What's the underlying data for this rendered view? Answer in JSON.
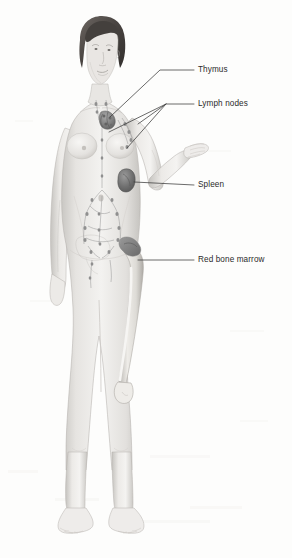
{
  "figure": {
    "background_color": "#fdfdfc",
    "line_color": "#3a3a3a",
    "text_color": "#2b2b2b"
  },
  "labels": [
    {
      "id": "thymus",
      "text": "Thymus",
      "text_x": 198,
      "text_y": 65,
      "icon": "leader-line-icon",
      "leaders": [
        {
          "points": "184,70 160,70 110,117"
        }
      ]
    },
    {
      "id": "lymph-nodes",
      "text": "Lymph nodes",
      "text_x": 198,
      "text_y": 99,
      "icon": "leader-line-icon",
      "leaders": [
        {
          "points": "184,104 166,104 109,132"
        },
        {
          "points": "184,104 166,104 127,148"
        },
        {
          "points": "184,104 166,104 138,124"
        }
      ]
    },
    {
      "id": "spleen",
      "text": "Spleen",
      "text_x": 198,
      "text_y": 180,
      "icon": "leader-line-icon",
      "leaders": [
        {
          "points": "184,185 134,182"
        }
      ]
    },
    {
      "id": "red-bone-marrow",
      "text": "Red bone marrow",
      "text_x": 198,
      "text_y": 255,
      "icon": "leader-line-icon",
      "leaders": [
        {
          "points": "184,260 138,260"
        }
      ]
    }
  ],
  "anatomy": {
    "thymus": {
      "name": "thymus-organ",
      "color": "#8e8e8e",
      "cx": 106,
      "cy": 120
    },
    "spleen": {
      "name": "spleen-organ",
      "color": "#7b7b7b",
      "cx": 128,
      "cy": 180
    },
    "red_bone_marrow": {
      "name": "red-bone-marrow-organ",
      "color": "#8a8a8a",
      "cx": 133,
      "cy": 262
    },
    "femur": {
      "name": "femur-bone",
      "color": "#d8d6d2"
    },
    "lymph_vessels": {
      "name": "lymph-vessel-network",
      "color": "#9a9a9a"
    },
    "skin": {
      "color": "#ececea"
    },
    "skin_shadow": {
      "color": "#cfcdc9"
    },
    "hair": {
      "color": "#4a4542"
    }
  }
}
